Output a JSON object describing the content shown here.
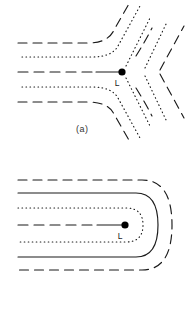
{
  "figure": {
    "type": "line-diagram",
    "background_color": "#ffffff",
    "stroke_color": "#1a1a1a",
    "width": 196,
    "height": 310,
    "panels": [
      {
        "id": "a",
        "caption": "(a)",
        "caption_x": 76,
        "caption_y": 124,
        "description": "X-point separatrix configuration: five contours entering from the left, bending at a central null point and diverging to the upper-right and lower-right",
        "null_point": {
          "label": "L",
          "x": 122,
          "y": 72,
          "dot_radius": 3.6,
          "label_x": 117,
          "label_y": 84
        },
        "stub": {
          "x1": 96,
          "y1": 72,
          "x2": 122,
          "y2": 72,
          "style": "solid"
        },
        "contours": [
          {
            "name": "dash-upper-outer",
            "style": "dashed",
            "offset": -29
          },
          {
            "name": "dot-upper-inner",
            "style": "dotted",
            "offset": -15
          },
          {
            "name": "dash-axis",
            "style": "dashed",
            "offset": 0
          },
          {
            "name": "dot-lower-inner",
            "style": "dotted",
            "offset": 15
          },
          {
            "name": "dash-lower-outer",
            "style": "dashed",
            "offset": 29
          }
        ],
        "outgoing": [
          {
            "name": "dot-ur-1",
            "style": "dotted",
            "quadrant": "upper-right"
          },
          {
            "name": "dash-ur-2",
            "style": "dashed",
            "quadrant": "upper-right"
          },
          {
            "name": "dot-ur-3",
            "style": "dotted",
            "quadrant": "upper-right"
          },
          {
            "name": "dash-ur-4",
            "style": "dashed",
            "quadrant": "upper-right"
          },
          {
            "name": "dot-lr-1",
            "style": "dotted",
            "quadrant": "lower-right"
          },
          {
            "name": "dash-lr-2",
            "style": "dashed",
            "quadrant": "lower-right"
          },
          {
            "name": "dot-lr-3",
            "style": "dotted",
            "quadrant": "lower-right"
          },
          {
            "name": "dash-lr-4",
            "style": "dashed",
            "quadrant": "lower-right"
          }
        ]
      },
      {
        "id": "b",
        "caption": "(b)",
        "caption_x": 88,
        "caption_y": 288,
        "description": "Nested closed loops: concentric rounded horseshoe contours open to the left, wrapping a central point L",
        "null_point": {
          "label": "L",
          "x": 125,
          "y": 225,
          "dot_radius": 3.6,
          "label_x": 120,
          "label_y": 237
        },
        "stub": {
          "x1": 97,
          "y1": 225,
          "x2": 125,
          "y2": 225,
          "style": "solid"
        },
        "loops": [
          {
            "name": "loop-dotted-inner",
            "style": "dotted",
            "half_height": 17,
            "right_x": 138
          },
          {
            "name": "loop-solid-mid",
            "style": "solid",
            "half_height": 32,
            "right_x": 153
          },
          {
            "name": "loop-dashed-outer",
            "style": "dashed",
            "half_height": 45,
            "right_x": 167
          },
          {
            "name": "axis-dashed",
            "style": "dashed",
            "half_height": 0,
            "right_x": 97
          }
        ]
      }
    ]
  },
  "labels": {
    "null_point_l": "L",
    "panel_a_caption": "(a)",
    "panel_b_caption": "(b)"
  }
}
